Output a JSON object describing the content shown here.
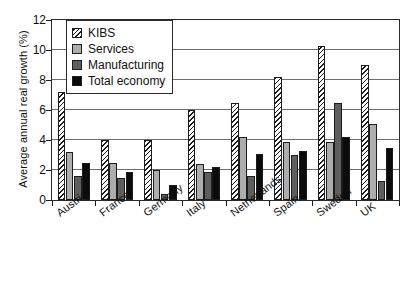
{
  "chart_data": {
    "type": "bar",
    "title": "",
    "xlabel": "",
    "ylabel": "Average annual real growth (%)",
    "ylim": [
      0,
      12
    ],
    "yticks": [
      0,
      2,
      4,
      6,
      8,
      10,
      12
    ],
    "ytick_labels": [
      "0",
      "2",
      "4",
      "6",
      "8",
      "10",
      "12"
    ],
    "grid": "horizontal",
    "legend_position": "upper-left-inside",
    "categories": [
      "Austria",
      "France",
      "Germany",
      "Italy",
      "Netherlands",
      "Spain",
      "Sweden",
      "UK"
    ],
    "series": [
      {
        "name": "KIBS",
        "swatch": "hatched",
        "color": "#ffffff",
        "values": [
          7.2,
          4.0,
          4.0,
          6.0,
          6.5,
          8.2,
          10.3,
          9.0
        ]
      },
      {
        "name": "Services",
        "swatch": "light-gray",
        "color": "#adadad",
        "values": [
          3.2,
          2.5,
          2.0,
          2.4,
          4.2,
          3.9,
          3.9,
          5.1
        ]
      },
      {
        "name": "Manufacturing",
        "swatch": "dark-gray",
        "color": "#5e5e5e",
        "values": [
          1.6,
          1.5,
          0.4,
          1.9,
          1.6,
          3.0,
          6.5,
          1.3
        ]
      },
      {
        "name": "Total economy",
        "swatch": "black",
        "color": "#0b0b0b",
        "values": [
          2.5,
          1.9,
          1.0,
          2.2,
          3.1,
          3.3,
          4.2,
          3.5
        ]
      }
    ]
  }
}
